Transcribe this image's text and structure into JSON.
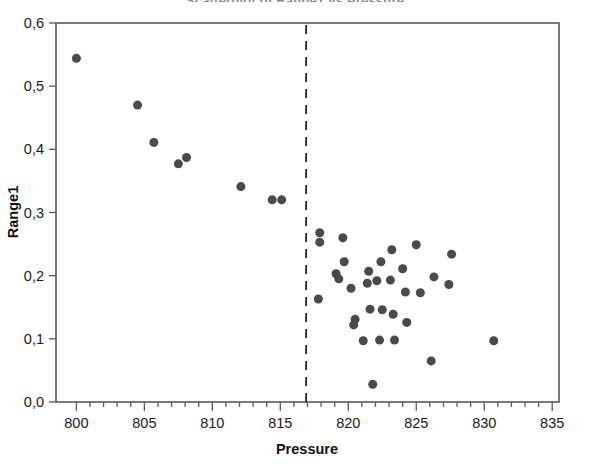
{
  "chart_data": {
    "type": "scatter",
    "title": "Scatterplot of Range1 vs Pressure",
    "xlabel": "Pressure",
    "ylabel": "Range1",
    "xlim": [
      798.5,
      835.5
    ],
    "ylim": [
      0.0,
      0.6
    ],
    "xticks": [
      800,
      805,
      810,
      815,
      820,
      825,
      830,
      835
    ],
    "xtick_labels": [
      "800",
      "805",
      "810",
      "815",
      "820",
      "825",
      "830",
      "835"
    ],
    "yticks": [
      0.0,
      0.1,
      0.2,
      0.3,
      0.4,
      0.5,
      0.6
    ],
    "ytick_labels": [
      "0,0",
      "0,1",
      "0,2",
      "0,3",
      "0,4",
      "0,5",
      "0,6"
    ],
    "xtick_minor_step": 1,
    "grid": false,
    "legend": null,
    "decimal_separator": ",",
    "marker_color": "#4a4a4a",
    "marker_size": 9,
    "annotations": [
      {
        "name": "vertical-reference-line",
        "type": "vline",
        "x": 816.9,
        "style": "dashed",
        "color": "#1a1a1a"
      }
    ],
    "series": [
      {
        "name": "Range1",
        "points": [
          [
            800.0,
            0.544
          ],
          [
            804.5,
            0.47
          ],
          [
            805.7,
            0.411
          ],
          [
            807.5,
            0.377
          ],
          [
            808.1,
            0.387
          ],
          [
            812.1,
            0.341
          ],
          [
            814.4,
            0.32
          ],
          [
            815.1,
            0.32
          ],
          [
            817.9,
            0.268
          ],
          [
            817.9,
            0.253
          ],
          [
            817.8,
            0.163
          ],
          [
            819.6,
            0.26
          ],
          [
            819.7,
            0.222
          ],
          [
            819.1,
            0.203
          ],
          [
            819.3,
            0.195
          ],
          [
            820.2,
            0.18
          ],
          [
            820.5,
            0.131
          ],
          [
            820.4,
            0.122
          ],
          [
            821.5,
            0.207
          ],
          [
            821.4,
            0.188
          ],
          [
            821.6,
            0.147
          ],
          [
            821.1,
            0.097
          ],
          [
            821.8,
            0.028
          ],
          [
            822.4,
            0.222
          ],
          [
            822.1,
            0.192
          ],
          [
            822.5,
            0.146
          ],
          [
            822.3,
            0.098
          ],
          [
            823.2,
            0.241
          ],
          [
            823.1,
            0.193
          ],
          [
            823.3,
            0.139
          ],
          [
            823.4,
            0.098
          ],
          [
            824.0,
            0.211
          ],
          [
            824.2,
            0.174
          ],
          [
            824.3,
            0.126
          ],
          [
            825.0,
            0.249
          ],
          [
            825.3,
            0.173
          ],
          [
            826.3,
            0.198
          ],
          [
            826.1,
            0.065
          ],
          [
            827.6,
            0.234
          ],
          [
            827.4,
            0.186
          ],
          [
            830.7,
            0.097
          ]
        ]
      }
    ]
  },
  "axes": {
    "y_axis_title": "Range1",
    "x_axis_title": "Pressure"
  }
}
